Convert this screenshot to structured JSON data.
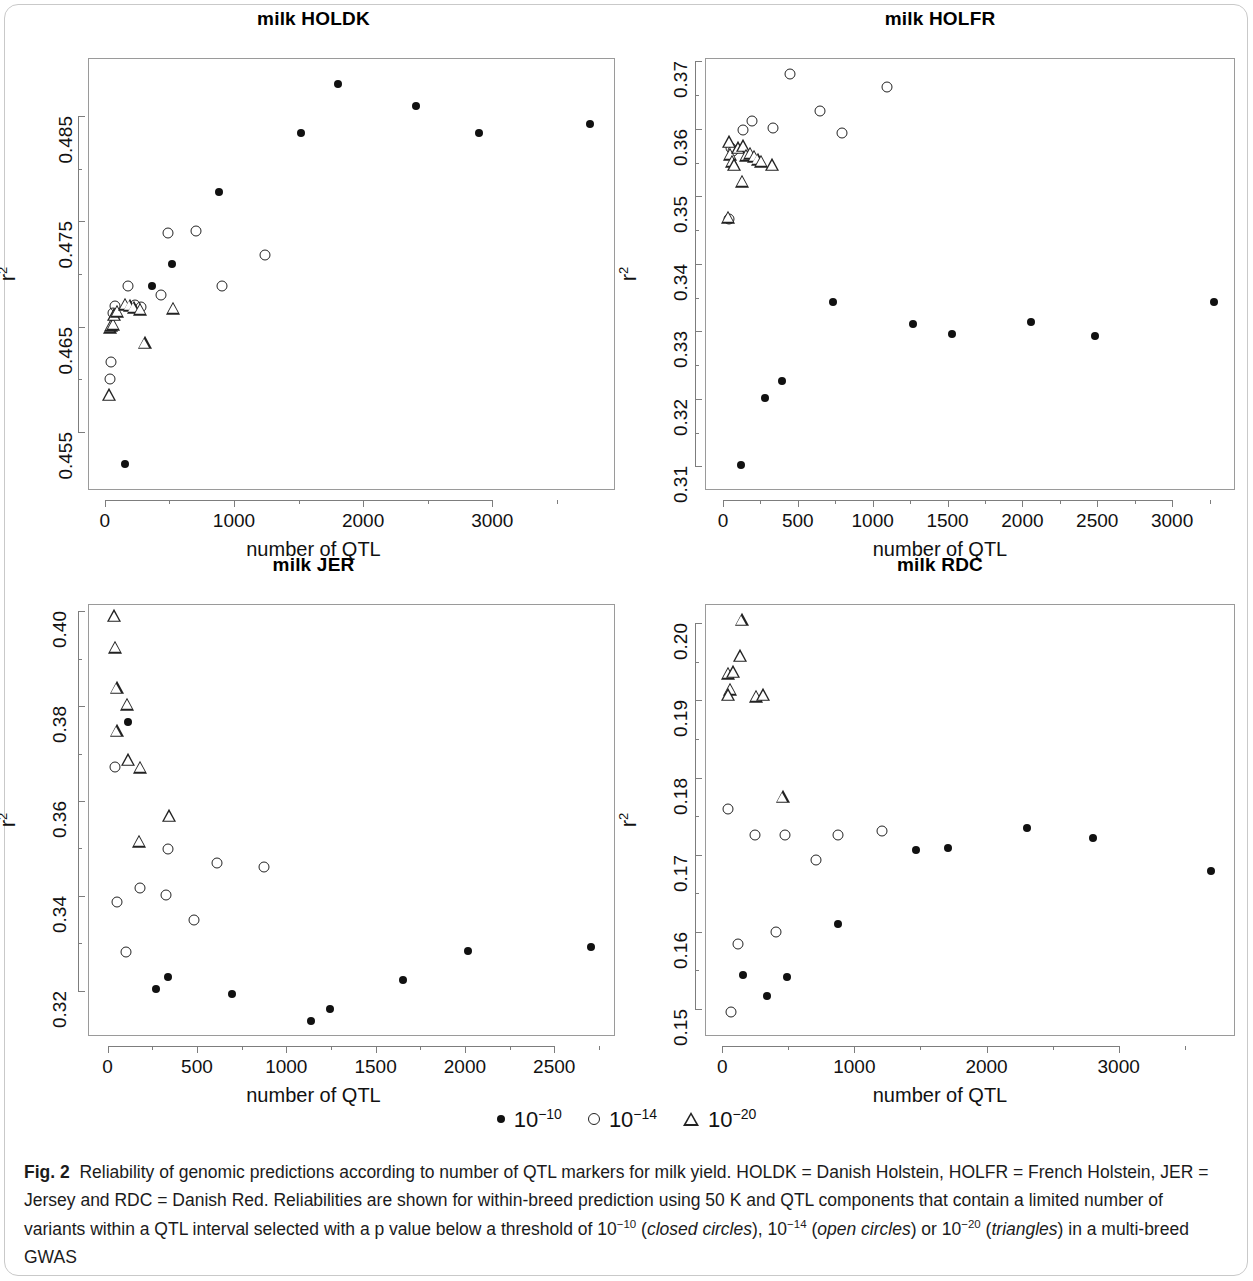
{
  "figure": {
    "label": "Fig. 2",
    "caption_part1": "Reliability of genomic predictions according to number of QTL markers for milk yield. HOLDK = Danish Holstein, HOLFR = French Holstein, JER = Jersey and RDC = Danish Red. Reliabilities are shown for within-breed prediction using 50 K and QTL components that contain a limited number of variants within a QTL interval selected with a p value below a threshold of 10",
    "exp1": "−10",
    "caption_mid1": " (",
    "italic1": "closed circles",
    "caption_mid2": "), 10",
    "exp2": "−14",
    "caption_mid3": " (",
    "italic2": "open circles",
    "caption_mid4": ") or 10",
    "exp3": "−20",
    "caption_mid5": " (",
    "italic3": "triangles",
    "caption_end": ") in a multi-breed GWAS"
  },
  "legend": {
    "items": [
      {
        "symbol": "closed-circle",
        "base": "10",
        "exponent": "−10"
      },
      {
        "symbol": "open-circle",
        "base": "10",
        "exponent": "−14"
      },
      {
        "symbol": "triangle",
        "base": "10",
        "exponent": "−20"
      }
    ]
  },
  "chart_data": [
    {
      "id": "holdk",
      "type": "scatter",
      "title": "milk HOLDK",
      "xlabel": "number of QTL",
      "ylabel": "r2",
      "xlim": [
        -130,
        3950
      ],
      "ylim": [
        0.4495,
        0.4905
      ],
      "xticks": [
        0,
        1000,
        2000,
        3000
      ],
      "xticklabels": [
        "0",
        "1000",
        "2000",
        "3000"
      ],
      "xminorticks": [
        500,
        1500,
        2500,
        3500
      ],
      "yticks": [
        0.455,
        0.465,
        0.475,
        0.485
      ],
      "yticklabels": [
        "0.455",
        "0.465",
        "0.475",
        "0.485"
      ],
      "yminorticks": [
        0.46,
        0.47,
        0.48
      ],
      "grid": false,
      "series": [
        {
          "name": "10^-10",
          "symbol": "closed-circle",
          "points": [
            [
              150,
              0.4521
            ],
            [
              360,
              0.469
            ],
            [
              510,
              0.471
            ],
            [
              880,
              0.4779
            ],
            [
              1510,
              0.4835
            ],
            [
              1800,
              0.4881
            ],
            [
              2400,
              0.486
            ],
            [
              2890,
              0.4835
            ],
            [
              3750,
              0.4843
            ]
          ]
        },
        {
          "name": "10^-14",
          "symbol": "open-circle",
          "points": [
            [
              30,
              0.4601
            ],
            [
              40,
              0.4617
            ],
            [
              55,
              0.4664
            ],
            [
              70,
              0.4671
            ],
            [
              175,
              0.469
            ],
            [
              225,
              0.4672
            ],
            [
              270,
              0.467
            ],
            [
              430,
              0.4681
            ],
            [
              480,
              0.474
            ],
            [
              700,
              0.4742
            ],
            [
              900,
              0.469
            ],
            [
              1230,
              0.4719
            ]
          ]
        },
        {
          "name": "10^-20",
          "symbol": "triangle",
          "points": [
            [
              25,
              0.4586
            ],
            [
              30,
              0.465
            ],
            [
              40,
              0.4652
            ],
            [
              55,
              0.4653
            ],
            [
              65,
              0.4662
            ],
            [
              90,
              0.4665
            ],
            [
              150,
              0.4672
            ],
            [
              185,
              0.4671
            ],
            [
              215,
              0.4669
            ],
            [
              265,
              0.4667
            ],
            [
              300,
              0.4635
            ],
            [
              520,
              0.4668
            ]
          ]
        }
      ]
    },
    {
      "id": "holfr",
      "type": "scatter",
      "title": "milk HOLFR",
      "xlabel": "number of QTL",
      "ylabel": "r2",
      "xlim": [
        -120,
        3420
      ],
      "ylim": [
        0.3065,
        0.3705
      ],
      "xticks": [
        0,
        500,
        1000,
        1500,
        2000,
        2500,
        3000
      ],
      "xticklabels": [
        "0",
        "500",
        "1000",
        "1500",
        "2000",
        "2500",
        "3000"
      ],
      "xminorticks": [
        250,
        750,
        1250,
        1750,
        2250,
        2750,
        3250
      ],
      "yticks": [
        0.31,
        0.32,
        0.33,
        0.34,
        0.35,
        0.36,
        0.37
      ],
      "yticklabels": [
        "0.31",
        "0.32",
        "0.33",
        "0.34",
        "0.35",
        "0.36",
        "0.37"
      ],
      "yminorticks": [
        0.315,
        0.325,
        0.335,
        0.345,
        0.355,
        0.365
      ],
      "grid": false,
      "series": [
        {
          "name": "10^-10",
          "symbol": "closed-circle",
          "points": [
            [
              115,
              0.3103
            ],
            [
              275,
              0.3203
            ],
            [
              390,
              0.3228
            ],
            [
              730,
              0.3345
            ],
            [
              1260,
              0.3313
            ],
            [
              1520,
              0.3297
            ],
            [
              2050,
              0.3316
            ],
            [
              2480,
              0.3294
            ],
            [
              3270,
              0.3345
            ]
          ]
        },
        {
          "name": "10^-14",
          "symbol": "open-circle",
          "points": [
            [
              35,
              0.3468
            ],
            [
              45,
              0.3573
            ],
            [
              60,
              0.3568
            ],
            [
              130,
              0.36
            ],
            [
              190,
              0.3613
            ],
            [
              330,
              0.3603
            ],
            [
              440,
              0.3683
            ],
            [
              640,
              0.3628
            ],
            [
              790,
              0.3596
            ],
            [
              1090,
              0.3663
            ]
          ]
        },
        {
          "name": "10^-20",
          "symbol": "triangle",
          "points": [
            [
              30,
              0.347
            ],
            [
              35,
              0.3582
            ],
            [
              40,
              0.3563
            ],
            [
              55,
              0.3553
            ],
            [
              70,
              0.3548
            ],
            [
              95,
              0.3573
            ],
            [
              130,
              0.3576
            ],
            [
              150,
              0.3562
            ],
            [
              175,
              0.3565
            ],
            [
              200,
              0.356
            ],
            [
              225,
              0.3556
            ],
            [
              250,
              0.3553
            ],
            [
              120,
              0.3523
            ],
            [
              320,
              0.3548
            ]
          ]
        }
      ]
    },
    {
      "id": "jer",
      "type": "scatter",
      "title": "milk JER",
      "xlabel": "number of QTL",
      "ylabel": "r2",
      "xlim": [
        -110,
        2840
      ],
      "ylim": [
        0.3105,
        0.4015
      ],
      "xticks": [
        0,
        500,
        1000,
        1500,
        2000,
        2500
      ],
      "xticklabels": [
        "0",
        "500",
        "1000",
        "1500",
        "2000",
        "2500"
      ],
      "xminorticks": [
        250,
        750,
        1250,
        1750,
        2250,
        2750
      ],
      "yticks": [
        0.32,
        0.34,
        0.36,
        0.38,
        0.4
      ],
      "yticklabels": [
        "0.32",
        "0.34",
        "0.36",
        "0.38",
        "0.40"
      ],
      "yminorticks": [
        0.33,
        0.35,
        0.37,
        0.39
      ],
      "grid": false,
      "series": [
        {
          "name": "10^-10",
          "symbol": "closed-circle",
          "points": [
            [
              110,
              0.3768
            ],
            [
              265,
              0.3206
            ],
            [
              330,
              0.3231
            ],
            [
              690,
              0.3196
            ],
            [
              1130,
              0.3139
            ],
            [
              1240,
              0.3165
            ],
            [
              1650,
              0.3226
            ],
            [
              2010,
              0.3287
            ],
            [
              2700,
              0.3295
            ]
          ]
        },
        {
          "name": "10^-14",
          "symbol": "open-circle",
          "points": [
            [
              35,
              0.3674
            ],
            [
              45,
              0.3389
            ],
            [
              95,
              0.3285
            ],
            [
              175,
              0.3418
            ],
            [
              320,
              0.3405
            ],
            [
              335,
              0.35
            ],
            [
              480,
              0.3351
            ],
            [
              605,
              0.3471
            ],
            [
              870,
              0.3463
            ]
          ]
        },
        {
          "name": "10^-20",
          "symbol": "triangle",
          "points": [
            [
              30,
              0.3991
            ],
            [
              35,
              0.3925
            ],
            [
              45,
              0.384
            ],
            [
              105,
              0.3805
            ],
            [
              45,
              0.3749
            ],
            [
              110,
              0.3688
            ],
            [
              175,
              0.3672
            ],
            [
              340,
              0.357
            ],
            [
              170,
              0.3516
            ]
          ]
        }
      ]
    },
    {
      "id": "rdc",
      "type": "scatter",
      "title": "milk RDC",
      "xlabel": "number of QTL",
      "ylabel": "r2",
      "xlim": [
        -130,
        3880
      ],
      "ylim": [
        0.1465,
        0.2025
      ],
      "xticks": [
        0,
        1000,
        2000,
        3000
      ],
      "xticklabels": [
        "0",
        "1000",
        "2000",
        "3000"
      ],
      "xminorticks": [
        500,
        1500,
        2500,
        3500
      ],
      "yticks": [
        0.15,
        0.16,
        0.17,
        0.18,
        0.19,
        0.2
      ],
      "yticklabels": [
        "0.15",
        "0.16",
        "0.17",
        "0.18",
        "0.19",
        "0.20"
      ],
      "yminorticks": [
        0.155,
        0.165,
        0.175,
        0.185,
        0.195
      ],
      "grid": false,
      "series": [
        {
          "name": "10^-10",
          "symbol": "closed-circle",
          "points": [
            [
              150,
              0.1545
            ],
            [
              330,
              0.1518
            ],
            [
              480,
              0.1543
            ],
            [
              870,
              0.1612
            ],
            [
              1460,
              0.1707
            ],
            [
              1700,
              0.171
            ],
            [
              2300,
              0.1736
            ],
            [
              2800,
              0.1723
            ],
            [
              3690,
              0.168
            ]
          ]
        },
        {
          "name": "10^-14",
          "symbol": "open-circle",
          "points": [
            [
              60,
              0.1497
            ],
            [
              110,
              0.1585
            ],
            [
              40,
              0.1761
            ],
            [
              240,
              0.1727
            ],
            [
              400,
              0.1601
            ],
            [
              470,
              0.1727
            ],
            [
              700,
              0.1694
            ],
            [
              870,
              0.1727
            ],
            [
              1200,
              0.1732
            ]
          ]
        },
        {
          "name": "10^-20",
          "symbol": "triangle",
          "points": [
            [
              140,
              0.2005
            ],
            [
              130,
              0.1959
            ],
            [
              40,
              0.1936
            ],
            [
              75,
              0.1938
            ],
            [
              55,
              0.1915
            ],
            [
              35,
              0.1908
            ],
            [
              250,
              0.1906
            ],
            [
              300,
              0.1908
            ],
            [
              450,
              0.1776
            ]
          ]
        }
      ]
    }
  ]
}
